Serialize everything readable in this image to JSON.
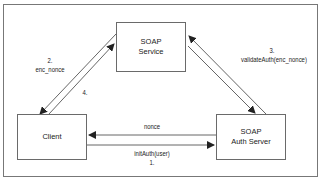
{
  "diagram": {
    "nodes": {
      "soap_service": {
        "line1": "SOAP",
        "line2": "Service"
      },
      "client": {
        "line1": "Client"
      },
      "auth_server": {
        "line1": "SOAP",
        "line2": "Auth Server"
      }
    },
    "edges": {
      "step1": {
        "step": "1.",
        "label": "initAuth(user)",
        "from": "Client",
        "to": "SOAP Auth Server"
      },
      "nonce": {
        "label": "nonce",
        "from": "SOAP Auth Server",
        "to": "Client"
      },
      "step2": {
        "step": "2.",
        "label": "enc_nonce",
        "from": "Client",
        "to": "SOAP Service"
      },
      "step3": {
        "step": "3.",
        "label": "validateAuth(enc_nonce)",
        "from": "SOAP Service",
        "to": "SOAP Auth Server"
      },
      "step4": {
        "step": "4.",
        "from": "SOAP Service",
        "to": "Client"
      }
    },
    "colors": {
      "line": "#555555",
      "border": "#6a6a6a",
      "text": "#222222"
    }
  }
}
